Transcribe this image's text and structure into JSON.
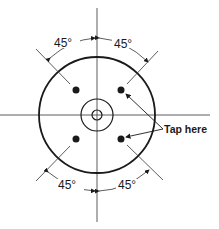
{
  "diagram": {
    "angles": {
      "top_left": "45°",
      "top_right": "45°",
      "bottom_left": "45°",
      "bottom_right": "45°"
    },
    "callout": "Tap here",
    "ink_color": "#1a1a1a"
  }
}
